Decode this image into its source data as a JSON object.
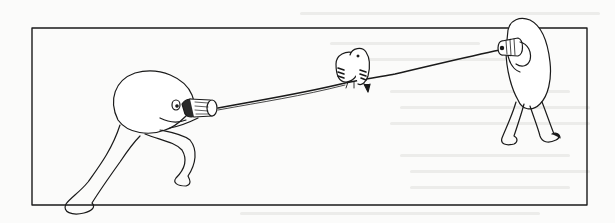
{
  "illustration": {
    "description": "Line drawing of two blob-headed figures communicating with a tin-can telephone; two birds perch on the string between them",
    "frame": {
      "x": 32,
      "y": 28,
      "width": 555,
      "height": 177,
      "stroke": "#1a1a1a"
    },
    "ink_color": "#1a1a1a",
    "paper_color": "#fbfbfa",
    "elements": [
      {
        "name": "left-figure",
        "action": "speaking into tin can, lunging pose"
      },
      {
        "name": "string",
        "from": "left tin can",
        "to": "right tin can"
      },
      {
        "name": "birds",
        "count": 2,
        "position": "perched on string at center"
      },
      {
        "name": "right-figure",
        "action": "listening through tin can, hunched pose"
      }
    ]
  }
}
